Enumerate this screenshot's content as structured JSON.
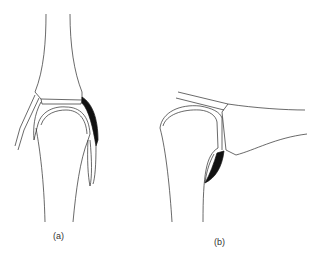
{
  "figure": {
    "panels": [
      {
        "id": "a",
        "label": "(a)",
        "description": "Joint in extension, front view with dark cap shown on right side"
      },
      {
        "id": "b",
        "label": "(b)",
        "description": "Joint in flexion, side view with dark cap at lower margin"
      }
    ],
    "colors": {
      "stroke": "#2a2a2a",
      "fill_dark": "#111111",
      "background": "#ffffff"
    }
  }
}
